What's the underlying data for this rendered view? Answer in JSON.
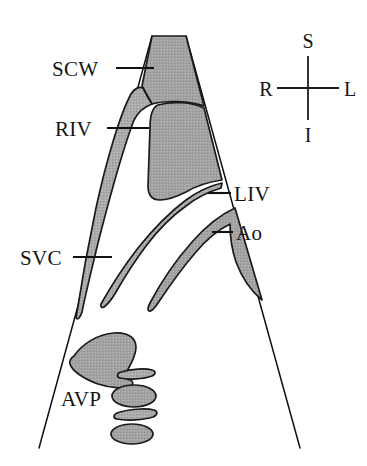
{
  "figure": {
    "background_color": "#ffffff",
    "ink_color": "#111111",
    "fill_gray": "#a2a2a2",
    "fill_gray_light": "#b3b3b3"
  },
  "labels": {
    "scw": "SCW",
    "riv": "RIV",
    "svc": "SVC",
    "liv": "LIV",
    "ao": "Ao",
    "avp": "AVP"
  },
  "compass": {
    "superior": "S",
    "inferior": "I",
    "right": "R",
    "left": "L"
  },
  "annotations": [
    {
      "key": "scw",
      "text": "SCW",
      "side": "left",
      "leader_from_x": 116,
      "leader_to_x": 152,
      "leader_y": 68
    },
    {
      "key": "riv",
      "text": "RIV",
      "side": "left",
      "leader_from_x": 107,
      "leader_to_x": 149,
      "leader_y": 128
    },
    {
      "key": "svc",
      "text": "SVC",
      "side": "left",
      "leader_from_x": 73,
      "leader_to_x": 112,
      "leader_y": 257
    },
    {
      "key": "liv",
      "text": "LIV",
      "side": "right",
      "leader_from_x": 208,
      "leader_to_x": 230,
      "leader_y": 193
    },
    {
      "key": "ao",
      "text": "Ao",
      "side": "right",
      "leader_from_x": 212,
      "leader_to_x": 232,
      "leader_y": 232
    },
    {
      "key": "avp",
      "text": "AVP",
      "side": "left",
      "leader_from_x": 0,
      "leader_to_x": 0,
      "leader_y": 398
    }
  ]
}
